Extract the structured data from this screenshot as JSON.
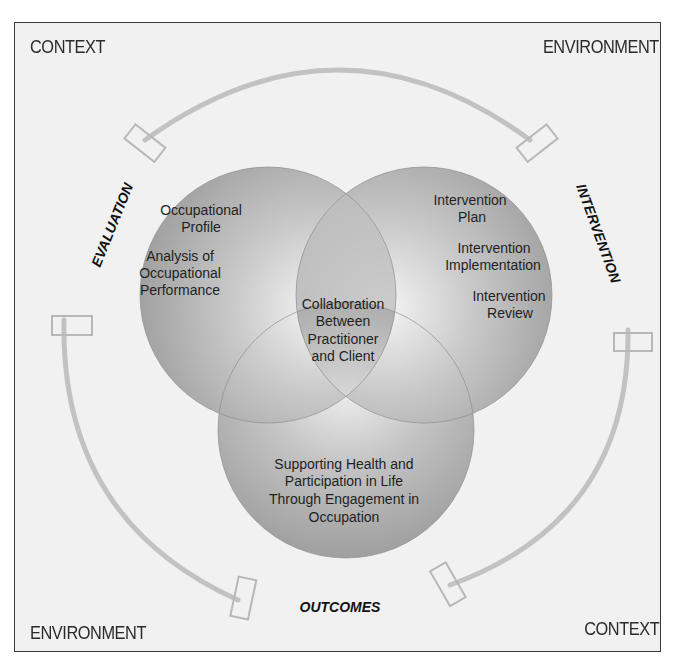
{
  "corners": {
    "top_left": "CONTEXT",
    "top_right": "ENVIRONMENT",
    "bottom_left": "ENVIRONMENT",
    "bottom_right": "CONTEXT"
  },
  "process_labels": {
    "left": "EVALUATION",
    "right": "INTERVENTION",
    "bottom": "OUTCOMES"
  },
  "circles": {
    "evaluation": {
      "lines": [
        "Occupational",
        "Profile",
        "Analysis of",
        "Occupational",
        "Performance"
      ]
    },
    "intervention": {
      "lines": [
        "Intervention",
        "Plan",
        "Intervention",
        "Implementation",
        "Intervention",
        "Review"
      ]
    },
    "outcomes": {
      "lines": [
        "Supporting Health and",
        "Participation in Life",
        "Through Engagement in",
        "Occupation"
      ]
    },
    "center": {
      "lines": [
        "Collaboration",
        "Between",
        "Practitioner",
        "and Client"
      ]
    }
  },
  "colors": {
    "frame_bg": "#f1f1f1",
    "circle_dark": "#9a9a9a",
    "circle_light": "#ededed",
    "arc": "#c4c4c4",
    "text": "#1f1f1f"
  }
}
